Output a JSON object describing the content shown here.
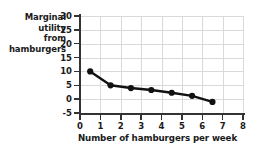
{
  "chart_data": {
    "type": "line",
    "title": "",
    "xlabel": "Number of hamburgers per week",
    "ylabel": "Marginal utility from hamburgers",
    "ylabel_lines": [
      "Marginal",
      "utility",
      "from",
      "hamburgers"
    ],
    "x": [
      0.5,
      1.5,
      2.5,
      3.5,
      4.5,
      5.5,
      6.5
    ],
    "values": [
      10,
      5,
      4,
      3.3,
      2.3,
      1.2,
      -1
    ],
    "series": [
      {
        "name": "Marginal utility from hamburgers",
        "values": [
          10,
          5,
          4,
          3.3,
          2.3,
          1.2,
          -1
        ]
      }
    ],
    "xlim": [
      0,
      8
    ],
    "ylim": [
      -5,
      30
    ],
    "xticks": [
      0,
      1,
      2,
      3,
      4,
      5,
      6,
      7,
      8
    ],
    "xtick_labels": [
      "0",
      "1",
      "2",
      "3",
      "4",
      "5",
      "6",
      "7",
      "8"
    ],
    "yticks": [
      -5,
      0,
      5,
      10,
      15,
      20,
      25,
      30
    ],
    "ytick_labels": [
      "-5",
      "0",
      "5",
      "10",
      "15",
      "20",
      "25",
      "30"
    ],
    "grid": true,
    "legend": false,
    "legend_position": "none",
    "line_color": "#111111",
    "marker_color": "#111111",
    "grid_color": "#d9d9d9",
    "axis_color": "#333333",
    "background_color": "#ffffff"
  }
}
